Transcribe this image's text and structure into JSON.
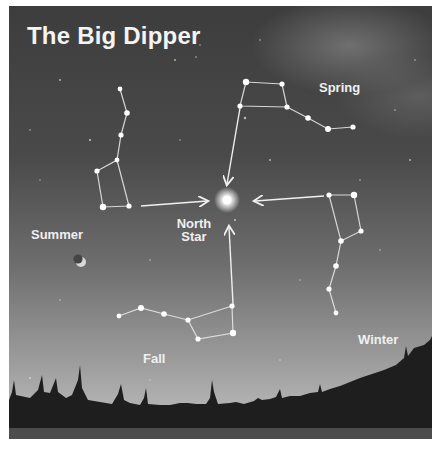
{
  "title": "The Big Dipper",
  "center_label": {
    "line1": "North",
    "line2": "Star"
  },
  "seasons": [
    {
      "name": "Spring",
      "label": "Spring"
    },
    {
      "name": "Summer",
      "label": "Summer"
    },
    {
      "name": "Fall",
      "label": "Fall"
    },
    {
      "name": "Winter",
      "label": "Winter"
    }
  ],
  "icons": {
    "moon": "crescent-moon-icon",
    "north_star": "star-icon"
  },
  "colors": {
    "sky_dark": "#3d3d3d",
    "sky_horizon": "#b2b2b2",
    "ground": "#1e1e1e",
    "text": "#f0f0f0"
  }
}
